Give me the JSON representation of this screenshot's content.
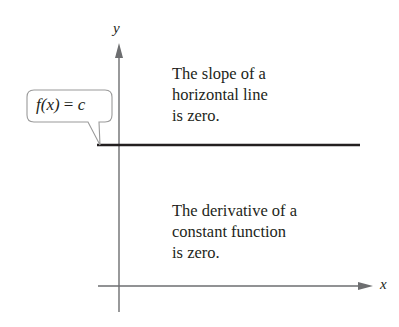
{
  "diagram": {
    "axes": {
      "x_label": "x",
      "y_label": "y",
      "color": "#6d6e70"
    },
    "function_line": {
      "description": "horizontal line",
      "color": "#231f20"
    },
    "callout": {
      "func": "f(x)",
      "equals": "=",
      "value": "c",
      "border_color": "#9a9a9a"
    },
    "notes": {
      "top": [
        "The slope of a",
        "horizontal line",
        "is zero."
      ],
      "bottom": [
        "The derivative of a",
        "constant function",
        "is zero."
      ]
    }
  }
}
